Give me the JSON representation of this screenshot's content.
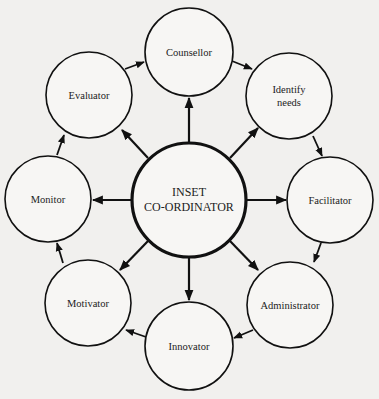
{
  "diagram": {
    "center": {
      "label_line1": "INSET",
      "label_line2": "CO-ORDINATOR"
    },
    "nodes": [
      {
        "id": "counsellor",
        "label_line1": "Counsellor",
        "label_line2": ""
      },
      {
        "id": "identify-needs",
        "label_line1": "Identify",
        "label_line2": "needs"
      },
      {
        "id": "facilitator",
        "label_line1": "Facilitator",
        "label_line2": ""
      },
      {
        "id": "administrator",
        "label_line1": "Administrator",
        "label_line2": ""
      },
      {
        "id": "innovator",
        "label_line1": "Innovator",
        "label_line2": ""
      },
      {
        "id": "motivator",
        "label_line1": "Motivator",
        "label_line2": ""
      },
      {
        "id": "monitor",
        "label_line1": "Monitor",
        "label_line2": ""
      },
      {
        "id": "evaluator",
        "label_line1": "Evaluator",
        "label_line2": ""
      }
    ],
    "edges_from_center": [
      "counsellor",
      "identify-needs",
      "facilitator",
      "administrator",
      "innovator",
      "motivator",
      "monitor",
      "evaluator"
    ],
    "cycle_edges": [
      [
        "evaluator",
        "counsellor"
      ],
      [
        "counsellor",
        "identify-needs"
      ],
      [
        "identify-needs",
        "facilitator"
      ],
      [
        "facilitator",
        "administrator"
      ],
      [
        "administrator",
        "innovator"
      ],
      [
        "innovator",
        "motivator"
      ],
      [
        "motivator",
        "monitor"
      ],
      [
        "monitor",
        "evaluator"
      ]
    ],
    "colors": {
      "background": "#f1f0ee",
      "stroke": "#111111",
      "fill": "#f7f6f4"
    }
  }
}
